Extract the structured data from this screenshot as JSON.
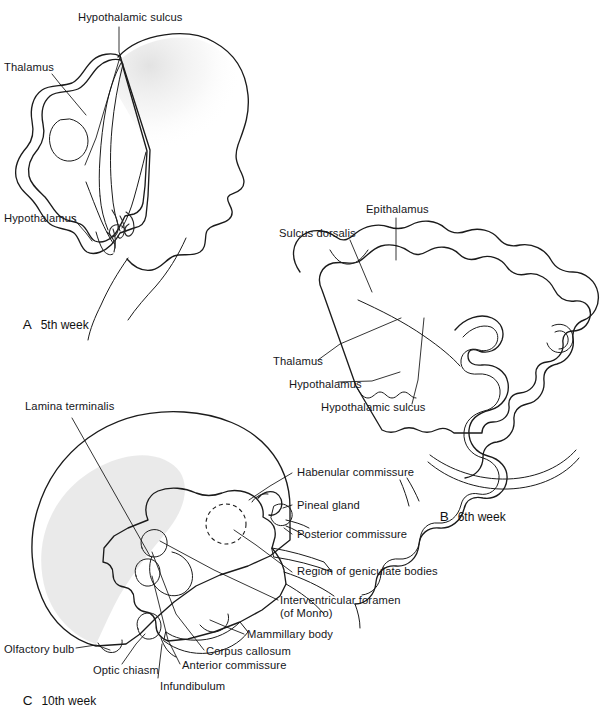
{
  "figure": {
    "panels": [
      {
        "id": "A",
        "key_letter": "A",
        "key_text": "5th week",
        "labels": [
          {
            "name": "hypothalamic-sulcus",
            "text": "Hypothalamic sulcus"
          },
          {
            "name": "thalamus",
            "text": "Thalamus"
          },
          {
            "name": "hypothalamus",
            "text": "Hypothalamus"
          }
        ],
        "signature": "RTJung"
      },
      {
        "id": "B",
        "key_letter": "B",
        "key_text": "6th week",
        "labels": [
          {
            "name": "epithalamus",
            "text": "Epithalamus"
          },
          {
            "name": "sulcus-dorsalis",
            "text": "Sulcus dorsalis"
          },
          {
            "name": "thalamus",
            "text": "Thalamus"
          },
          {
            "name": "hypothalamus",
            "text": "Hypothalamus"
          },
          {
            "name": "hypothalamic-sulcus",
            "text": "Hypothalamic sulcus"
          }
        ]
      },
      {
        "id": "C",
        "key_letter": "C",
        "key_text": "10th week",
        "labels": [
          {
            "name": "lamina-terminalis",
            "text": "Lamina terminalis"
          },
          {
            "name": "habenular-commissure",
            "text": "Habenular commissure"
          },
          {
            "name": "pineal-gland",
            "text": "Pineal gland"
          },
          {
            "name": "posterior-commissure",
            "text": "Posterior commissure"
          },
          {
            "name": "region-of-geniculate-bodies",
            "text": "Region of geniculate bodies"
          },
          {
            "name": "interventricular-foramen",
            "text": "Interventricular foramen"
          },
          {
            "name": "interventricular-foramen-sub",
            "text": "(of Monro)"
          },
          {
            "name": "mammillary-body",
            "text": "Mammillary body"
          },
          {
            "name": "corpus-callosum",
            "text": "Corpus callosum"
          },
          {
            "name": "anterior-commissure",
            "text": "Anterior commissure"
          },
          {
            "name": "infundibulum",
            "text": "Infundibulum"
          },
          {
            "name": "optic-chiasm",
            "text": "Optic chiasm"
          },
          {
            "name": "olfactory-bulb",
            "text": "Olfactory bulb"
          }
        ]
      }
    ],
    "colors": {
      "background": "#ffffff",
      "ink": "#1b1b1b",
      "tissue_light": "#f2f2f2",
      "tissue_mid": "#b9b9b9",
      "tissue_dark": "#8f8f8f",
      "mantle_gray": "#d4d4d4",
      "text": "#16161a"
    }
  }
}
